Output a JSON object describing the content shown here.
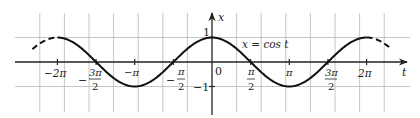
{
  "chart_data": {
    "type": "line",
    "title": "",
    "function_label": "x = cos t",
    "xlabel": "t",
    "ylabel": "x",
    "xlim": [
      -8,
      8
    ],
    "ylim": [
      -1.7,
      2.0
    ],
    "grid": true,
    "grid_spacing": 1,
    "x_ticks": [
      {
        "value": -6.2832,
        "label": "−2π"
      },
      {
        "value": -4.7124,
        "label": "−3π/2"
      },
      {
        "value": -3.1416,
        "label": "−π"
      },
      {
        "value": -1.5708,
        "label": "−π/2"
      },
      {
        "value": 0,
        "label": "0"
      },
      {
        "value": 1.5708,
        "label": "π/2"
      },
      {
        "value": 3.1416,
        "label": "π"
      },
      {
        "value": 4.7124,
        "label": "3π/2"
      },
      {
        "value": 6.2832,
        "label": "2π"
      }
    ],
    "y_ticks": [
      {
        "value": 1,
        "label": "1"
      },
      {
        "value": -1,
        "label": "−1"
      }
    ],
    "series": [
      {
        "name": "x = cos t",
        "style": "solid",
        "t_range": [
          -6.2832,
          6.2832
        ]
      },
      {
        "name": "x = cos t (continuation)",
        "style": "dashed",
        "t_range": [
          -7.3,
          -6.2832
        ]
      },
      {
        "name": "x = cos t (continuation)",
        "style": "dashed",
        "t_range": [
          6.2832,
          7.3
        ]
      }
    ],
    "points": {
      "maxima": [
        [
          -6.2832,
          1
        ],
        [
          0,
          1
        ],
        [
          6.2832,
          1
        ]
      ],
      "minima": [
        [
          -3.1416,
          -1
        ],
        [
          3.1416,
          -1
        ]
      ],
      "zeros": [
        [
          -4.7124,
          0
        ],
        [
          -1.5708,
          0
        ],
        [
          1.5708,
          0
        ],
        [
          4.7124,
          0
        ]
      ]
    }
  },
  "labels": {
    "function": "x = cos t",
    "axis_t": "t",
    "axis_x": "x",
    "one": "1",
    "minus_one": "−1",
    "zero": "0",
    "pi": "π",
    "two_pi": "2π",
    "minus_pi": "−π",
    "minus_two_pi": "−2π",
    "pi_num": "π",
    "three_pi_num": "3π",
    "den_2": "2",
    "minus": "−"
  },
  "colors": {
    "curve": "#111111",
    "axis": "#222222",
    "grid": "#b8b8b8",
    "text": "#222222"
  }
}
